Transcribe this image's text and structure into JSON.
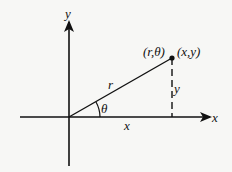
{
  "diagram": {
    "colors": {
      "background": "#f7f7f5",
      "ink": "#111111"
    },
    "labels": {
      "y_axis": "y",
      "x_axis": "x",
      "radius": "r",
      "angle": "θ",
      "x_leg": "x",
      "y_leg": "y",
      "polar_point": "(r,θ)",
      "rect_point": "(x,y)"
    },
    "geometry": {
      "origin": [
        69,
        117
      ],
      "point": [
        172,
        58
      ]
    }
  }
}
